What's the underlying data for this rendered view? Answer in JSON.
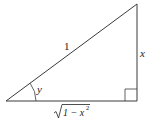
{
  "diagram": {
    "type": "right-triangle",
    "vertices": {
      "bottom_left": [
        6,
        101
      ],
      "right_angle": [
        137,
        101
      ],
      "top": [
        137,
        4
      ]
    },
    "labels": {
      "hypotenuse": "1",
      "vertical_side": "x",
      "angle": "y",
      "base_radicand": "1 − x",
      "base_exponent": "2"
    },
    "colors": {
      "stroke": "#3a3a3a",
      "text": "#222222",
      "background": "#ffffff"
    }
  }
}
